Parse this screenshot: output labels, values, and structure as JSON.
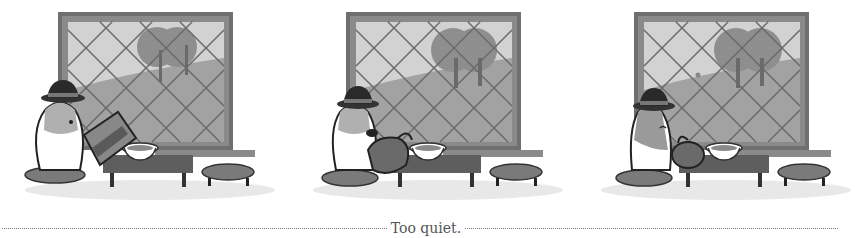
{
  "comic": {
    "panels": [
      {
        "index": 1,
        "scene": "bear-drinking-from-large-bottle",
        "offset_x": 0
      },
      {
        "index": 2,
        "scene": "bear-pouring-from-kettle",
        "offset_x": 288
      },
      {
        "index": 3,
        "scene": "bear-hugging-kettle-eyes-closed",
        "offset_x": 576
      }
    ],
    "caption": "Too quiet.",
    "colors": {
      "background": "#ffffff",
      "frame": "#6f6f6f",
      "frame_inner": "#8a8a8a",
      "sky": "#d0d0d0",
      "hill": "#9d9d9d",
      "tree": "#8a8a8a",
      "lattice": "#6a6a6a",
      "table": "#5e5e5e",
      "stool": "#7a7a7a",
      "floor_shadow": "#e6e6e6",
      "caption_text": "#555555"
    }
  }
}
